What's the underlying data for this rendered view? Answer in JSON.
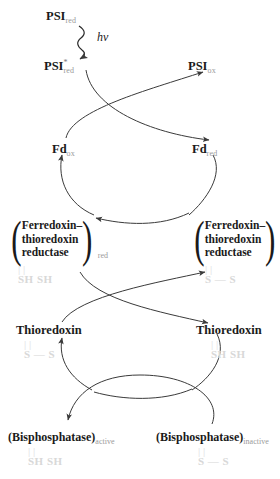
{
  "diagram": {
    "photon_label": "hv",
    "colors": {
      "ink": "#1a1a1a",
      "subscript": "#9a9a9a",
      "thiol": "#d8d8d8",
      "arrow": "#3a3a3a"
    },
    "stages": [
      {
        "id": "psi",
        "left": {
          "name": "PSI",
          "state": "red",
          "excited": true,
          "display": "PSI*red"
        },
        "top": {
          "name": "PSI",
          "state": "red",
          "display": "PSIred"
        },
        "right": {
          "name": "PSI",
          "state": "ox",
          "display": "PSIox"
        }
      },
      {
        "id": "fd",
        "left": {
          "name": "Fd",
          "state": "ox",
          "display": "Fdox"
        },
        "right": {
          "name": "Fd",
          "state": "red",
          "display": "Fdred"
        }
      },
      {
        "id": "ftr",
        "left": {
          "name": "Ferredoxin-thioredoxin reductase",
          "state": "red",
          "thiol": "SH SH"
        },
        "right": {
          "name": "Ferredoxin-thioredoxin reductase",
          "state": "ox",
          "thiol": "S-S"
        }
      },
      {
        "id": "trx",
        "left": {
          "name": "Thioredoxin",
          "thiol": "S-S"
        },
        "right": {
          "name": "Thioredoxin",
          "thiol": "SH SH"
        }
      },
      {
        "id": "bisphosphatase",
        "left": {
          "name": "Bisphosphatase",
          "state": "active",
          "thiol": "SH SH"
        },
        "right": {
          "name": "Bisphosphatase",
          "state": "inactive",
          "thiol": "S-S"
        }
      }
    ]
  },
  "labels": {
    "psi_red_top": "PSI",
    "psi_red_top_sub": "red",
    "psi_excited": "PSI",
    "psi_excited_star": "*",
    "psi_excited_sub": "red",
    "psi_ox": "PSI",
    "psi_ox_sub": "ox",
    "photon": "hv",
    "fd_ox": "Fd",
    "fd_ox_sub": "ox",
    "fd_red": "Fd",
    "fd_red_sub": "red",
    "ftr_line1": "Ferredoxin–",
    "ftr_line2": "thioredoxin",
    "ftr_line3": "reductase",
    "ftr_left_sub": "red",
    "ftr_right_sub": "ox",
    "paren_open": "(",
    "paren_close": ")",
    "thiol_reduced": "SH  SH",
    "thiol_oxidized": "S — S",
    "tick_double": "|      |",
    "tick_double_wide": "|        |",
    "thioredoxin_left": "Thioredoxin",
    "thioredoxin_right": "Thioredoxin",
    "bisphosphatase_active": "(Bisphosphatase)",
    "bisphosphatase_active_sub": "active",
    "bisphosphatase_inactive": "(Bisphosphatase)",
    "bisphosphatase_inactive_sub": "inactive"
  }
}
